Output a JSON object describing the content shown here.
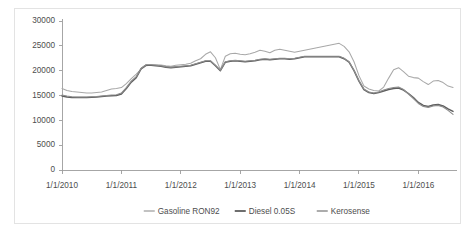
{
  "chart_data": {
    "type": "line",
    "title": "",
    "subtitle": "",
    "xlabel": "",
    "ylabel": "",
    "ylim": [
      0,
      30000
    ],
    "ytick_values": [
      0,
      5000,
      10000,
      15000,
      20000,
      25000,
      30000
    ],
    "ytick_labels": [
      "0",
      "5000",
      "10000",
      "15000",
      "20000",
      "25000",
      "30000"
    ],
    "xtick_labels": [
      "1/1/2010",
      "1/1/2011",
      "1/1/2012",
      "1/1/2013",
      "1/1/2014",
      "1/1/2015",
      "1/1/2016"
    ],
    "grid": false,
    "legend_position": "bottom",
    "x_start": "1/1/2010",
    "x_end": "1/1/2016",
    "x_step_months": 1,
    "series": [
      {
        "name": "Gasoline RON92",
        "color": "#a8a8a8",
        "values": [
          16400,
          16000,
          15800,
          15700,
          15600,
          15500,
          15500,
          15600,
          15700,
          16000,
          16300,
          16400,
          16600,
          17400,
          18400,
          19300,
          20300,
          21000,
          21100,
          21200,
          21150,
          21000,
          20900,
          21100,
          21200,
          21300,
          21500,
          22000,
          22400,
          23300,
          23800,
          22600,
          20200,
          22900,
          23400,
          23500,
          23300,
          23200,
          23400,
          23700,
          24100,
          23900,
          23600,
          24100,
          24300,
          24100,
          23900,
          23700,
          23900,
          24100,
          24300,
          24500,
          24700,
          24900,
          25100,
          25300,
          25500,
          24900,
          23800,
          21800,
          19000,
          16900,
          16300,
          16000,
          15900,
          16700,
          18500,
          20200,
          20600,
          19800,
          18900,
          18600,
          18500,
          17800,
          17200,
          17900,
          18000,
          17600,
          16900,
          16600
        ]
      },
      {
        "name": "Diesel 0.05S",
        "color": "#5e5e5e",
        "values": [
          14900,
          14700,
          14600,
          14600,
          14600,
          14600,
          14650,
          14700,
          14800,
          14900,
          14950,
          15000,
          15300,
          16400,
          17700,
          18600,
          20400,
          21100,
          21100,
          21000,
          20900,
          20700,
          20600,
          20700,
          20800,
          20900,
          21000,
          21300,
          21600,
          21900,
          21900,
          21000,
          20000,
          21700,
          21900,
          22000,
          21900,
          21800,
          21900,
          22000,
          22200,
          22300,
          22200,
          22300,
          22400,
          22400,
          22300,
          22400,
          22600,
          22800,
          22800,
          22800,
          22800,
          22800,
          22800,
          22800,
          22800,
          22400,
          21700,
          20000,
          17900,
          16200,
          15600,
          15400,
          15600,
          15900,
          16200,
          16400,
          16500,
          16100,
          15400,
          14600,
          13600,
          13000,
          12800,
          13100,
          13200,
          12900,
          12300,
          11800
        ]
      },
      {
        "name": "Kerosense",
        "color": "#8d8d8d",
        "values": [
          15100,
          14900,
          14750,
          14700,
          14700,
          14700,
          14750,
          14800,
          14900,
          15000,
          15100,
          15150,
          15500,
          16600,
          17900,
          18800,
          20500,
          21200,
          21200,
          21100,
          21000,
          20800,
          20700,
          20800,
          20900,
          21000,
          21100,
          21400,
          21700,
          22000,
          22000,
          21100,
          20100,
          21800,
          22000,
          22100,
          22000,
          21900,
          22000,
          22100,
          22300,
          22400,
          22300,
          22400,
          22500,
          22500,
          22400,
          22500,
          22700,
          22900,
          22900,
          22900,
          22900,
          22900,
          22900,
          22900,
          22900,
          22500,
          21800,
          20100,
          18000,
          16300,
          15700,
          15500,
          15700,
          16100,
          16400,
          16600,
          16700,
          16200,
          15300,
          14400,
          13400,
          12800,
          12600,
          12900,
          13000,
          12700,
          12000,
          11200
        ]
      }
    ]
  },
  "legend": {
    "items": [
      {
        "label": "Gasoline RON92"
      },
      {
        "label": "Diesel 0.05S"
      },
      {
        "label": "Kerosense"
      }
    ]
  },
  "colors": {
    "background": "#ffffff",
    "frame_border": "#e3e3e3",
    "axis": "#9c9c9c",
    "text": "#4d4d4d"
  }
}
